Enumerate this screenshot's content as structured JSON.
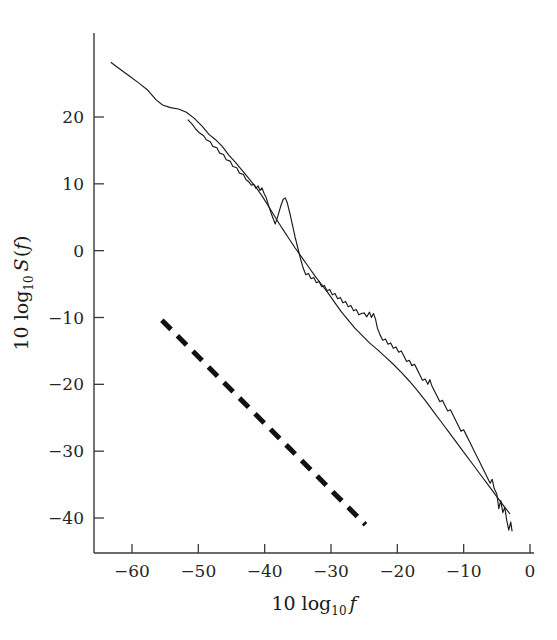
{
  "figure": {
    "name": "power-spectrum-plot",
    "background": "#ffffff",
    "ink": "#1a1a1a"
  },
  "chart_data": {
    "type": "line",
    "title": "",
    "xlabel_parts": {
      "lead": "10 log",
      "sub": "10",
      "var": "f"
    },
    "ylabel_parts": {
      "lead": "10 log",
      "sub": "10",
      "var": "S",
      "open": "(",
      "var2": "f",
      "close": ")"
    },
    "xlabel": "10 log10 f",
    "ylabel": "10 log10 S(f)",
    "xlim": [
      -66,
      3
    ],
    "ylim": [
      -46,
      31
    ],
    "xticks": [
      -60,
      -50,
      -40,
      -30,
      -20,
      -10,
      0
    ],
    "xtick_labels": [
      "−60",
      "−50",
      "−40",
      "−30",
      "−20",
      "−10",
      "0"
    ],
    "yticks": [
      20,
      10,
      0,
      -10,
      -20,
      -30,
      -40
    ],
    "ytick_labels": [
      "20",
      "10",
      "0",
      "−10",
      "−20",
      "−30",
      "−40"
    ],
    "grid": false,
    "legend": "none",
    "series": [
      {
        "name": "smooth-model-spectrum",
        "style": "solid-thin",
        "color": "#1a1a1a",
        "points": [
          [
            -63.2,
            28.2
          ],
          [
            -62.0,
            27.3
          ],
          [
            -60.5,
            26.2
          ],
          [
            -59.0,
            25.1
          ],
          [
            -57.6,
            24.0
          ],
          [
            -56.4,
            22.6
          ],
          [
            -55.4,
            21.8
          ],
          [
            -54.2,
            21.4
          ],
          [
            -53.0,
            21.2
          ],
          [
            -51.8,
            20.7
          ],
          [
            -50.6,
            19.8
          ],
          [
            -49.4,
            18.6
          ],
          [
            -48.4,
            17.4
          ],
          [
            -47.4,
            16.6
          ],
          [
            -46.4,
            15.6
          ],
          [
            -45.4,
            14.3
          ],
          [
            -44.4,
            13.2
          ],
          [
            -43.4,
            12.0
          ],
          [
            -42.4,
            10.8
          ],
          [
            -41.4,
            9.6
          ],
          [
            -40.4,
            8.2
          ],
          [
            -39.4,
            6.6
          ],
          [
            -38.4,
            5.0
          ],
          [
            -37.4,
            3.4
          ],
          [
            -36.4,
            1.9
          ],
          [
            -35.4,
            0.4
          ],
          [
            -34.4,
            -1.0
          ],
          [
            -33.4,
            -2.4
          ],
          [
            -32.4,
            -3.8
          ],
          [
            -31.4,
            -5.1
          ],
          [
            -30.4,
            -6.4
          ],
          [
            -29.4,
            -7.8
          ],
          [
            -28.4,
            -9.2
          ],
          [
            -27.4,
            -10.4
          ],
          [
            -26.4,
            -11.6
          ],
          [
            -25.2,
            -12.8
          ],
          [
            -24.2,
            -13.8
          ],
          [
            -23.0,
            -14.8
          ],
          [
            -21.8,
            -15.9
          ],
          [
            -20.6,
            -17.0
          ],
          [
            -19.4,
            -18.2
          ],
          [
            -18.2,
            -19.5
          ],
          [
            -17.0,
            -20.9
          ],
          [
            -15.8,
            -22.4
          ],
          [
            -14.6,
            -24.0
          ],
          [
            -13.4,
            -25.6
          ],
          [
            -12.2,
            -27.2
          ],
          [
            -11.0,
            -28.8
          ],
          [
            -9.8,
            -30.4
          ],
          [
            -8.6,
            -32.0
          ],
          [
            -7.4,
            -33.6
          ],
          [
            -6.2,
            -35.2
          ],
          [
            -5.0,
            -36.8
          ],
          [
            -3.8,
            -38.4
          ],
          [
            -3.0,
            -39.4
          ]
        ]
      },
      {
        "name": "measured-jagged-spectrum",
        "style": "solid-thin-jagged",
        "color": "#1a1a1a",
        "points": [
          [
            -51.6,
            19.6
          ],
          [
            -51.0,
            19.0
          ],
          [
            -50.4,
            18.2
          ],
          [
            -49.8,
            17.6
          ],
          [
            -49.2,
            17.2
          ],
          [
            -48.8,
            16.6
          ],
          [
            -48.2,
            16.3
          ],
          [
            -47.8,
            15.6
          ],
          [
            -47.2,
            15.4
          ],
          [
            -46.8,
            14.6
          ],
          [
            -46.2,
            14.4
          ],
          [
            -45.8,
            13.6
          ],
          [
            -45.2,
            13.4
          ],
          [
            -44.8,
            12.6
          ],
          [
            -44.2,
            12.4
          ],
          [
            -43.8,
            11.6
          ],
          [
            -43.2,
            11.4
          ],
          [
            -42.8,
            10.6
          ],
          [
            -42.4,
            10.3
          ],
          [
            -42.0,
            9.8
          ],
          [
            -41.6,
            9.9
          ],
          [
            -41.3,
            9.3
          ],
          [
            -41.0,
            9.7
          ],
          [
            -40.7,
            9.0
          ],
          [
            -40.4,
            9.4
          ],
          [
            -40.1,
            8.6
          ],
          [
            -39.8,
            8.0
          ],
          [
            -39.3,
            6.4
          ],
          [
            -38.8,
            5.0
          ],
          [
            -38.4,
            4.0
          ],
          [
            -38.0,
            5.2
          ],
          [
            -37.6,
            6.6
          ],
          [
            -37.2,
            7.7
          ],
          [
            -36.9,
            7.9
          ],
          [
            -36.6,
            7.2
          ],
          [
            -36.2,
            5.6
          ],
          [
            -35.8,
            3.8
          ],
          [
            -35.4,
            2.0
          ],
          [
            -35.0,
            0.4
          ],
          [
            -34.6,
            -1.2
          ],
          [
            -34.2,
            -2.6
          ],
          [
            -33.8,
            -3.6
          ],
          [
            -33.4,
            -3.4
          ],
          [
            -33.0,
            -4.2
          ],
          [
            -32.6,
            -4.0
          ],
          [
            -32.2,
            -4.8
          ],
          [
            -31.8,
            -4.6
          ],
          [
            -31.4,
            -5.4
          ],
          [
            -31.0,
            -5.2
          ],
          [
            -30.6,
            -6.0
          ],
          [
            -30.2,
            -5.8
          ],
          [
            -29.8,
            -6.6
          ],
          [
            -29.4,
            -6.4
          ],
          [
            -29.0,
            -7.2
          ],
          [
            -28.6,
            -7.0
          ],
          [
            -28.2,
            -7.8
          ],
          [
            -27.8,
            -7.6
          ],
          [
            -27.4,
            -8.4
          ],
          [
            -27.0,
            -8.2
          ],
          [
            -26.6,
            -9.0
          ],
          [
            -26.2,
            -8.8
          ],
          [
            -25.8,
            -9.6
          ],
          [
            -25.4,
            -9.4
          ],
          [
            -25.0,
            -9.3
          ],
          [
            -24.6,
            -9.9
          ],
          [
            -24.2,
            -9.2
          ],
          [
            -23.9,
            -10.0
          ],
          [
            -23.6,
            -9.4
          ],
          [
            -23.3,
            -10.2
          ],
          [
            -23.0,
            -11.6
          ],
          [
            -22.6,
            -12.6
          ],
          [
            -22.2,
            -13.4
          ],
          [
            -21.8,
            -13.2
          ],
          [
            -21.4,
            -14.0
          ],
          [
            -21.0,
            -13.8
          ],
          [
            -20.6,
            -14.6
          ],
          [
            -20.2,
            -14.4
          ],
          [
            -19.8,
            -15.2
          ],
          [
            -19.4,
            -15.0
          ],
          [
            -19.0,
            -15.8
          ],
          [
            -18.6,
            -16.6
          ],
          [
            -18.2,
            -16.4
          ],
          [
            -17.8,
            -17.2
          ],
          [
            -17.4,
            -17.0
          ],
          [
            -17.0,
            -17.8
          ],
          [
            -16.6,
            -18.6
          ],
          [
            -16.2,
            -19.4
          ],
          [
            -15.8,
            -19.2
          ],
          [
            -15.4,
            -20.0
          ],
          [
            -15.1,
            -19.3
          ],
          [
            -14.8,
            -20.2
          ],
          [
            -14.4,
            -21.0
          ],
          [
            -14.0,
            -21.8
          ],
          [
            -13.6,
            -22.6
          ],
          [
            -13.2,
            -22.4
          ],
          [
            -12.8,
            -23.2
          ],
          [
            -12.4,
            -24.0
          ],
          [
            -12.0,
            -23.8
          ],
          [
            -11.6,
            -24.6
          ],
          [
            -11.2,
            -25.4
          ],
          [
            -10.8,
            -26.2
          ],
          [
            -10.4,
            -27.0
          ],
          [
            -10.0,
            -26.8
          ],
          [
            -9.6,
            -27.6
          ],
          [
            -9.2,
            -28.4
          ],
          [
            -8.8,
            -29.2
          ],
          [
            -8.4,
            -30.0
          ],
          [
            -8.0,
            -30.8
          ],
          [
            -7.6,
            -31.6
          ],
          [
            -7.2,
            -32.4
          ],
          [
            -6.8,
            -33.2
          ],
          [
            -6.4,
            -34.0
          ],
          [
            -6.0,
            -34.8
          ],
          [
            -5.7,
            -34.2
          ],
          [
            -5.4,
            -35.6
          ],
          [
            -5.0,
            -36.4
          ],
          [
            -4.7,
            -38.6
          ],
          [
            -4.4,
            -37.4
          ],
          [
            -4.1,
            -39.2
          ],
          [
            -3.8,
            -38.4
          ],
          [
            -3.5,
            -40.4
          ],
          [
            -3.2,
            -41.8
          ],
          [
            -2.9,
            -40.6
          ],
          [
            -2.7,
            -42.0
          ]
        ]
      },
      {
        "name": "dashed-reference-slope",
        "style": "dashed-thick",
        "color": "#111111",
        "points": [
          [
            -55.5,
            -10.4
          ],
          [
            -24.8,
            -41.0
          ]
        ]
      }
    ]
  }
}
